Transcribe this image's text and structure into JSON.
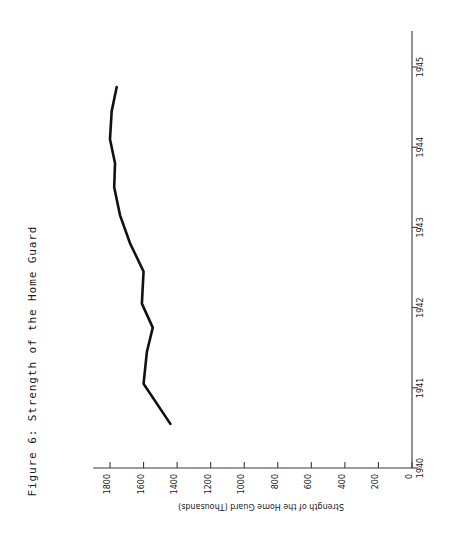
{
  "figure": {
    "caption": "Figure 6: Strength of the Home Guard",
    "orientation": "rotated-90-ccw",
    "background_color": "#ffffff",
    "line_color": "#111111",
    "axis_color": "#3a3a3a"
  },
  "chart_data": {
    "type": "line",
    "title": "Figure 6: Strength of the Home Guard",
    "xlabel": "",
    "ylabel": "Strength of the Home Guard (Thousands)",
    "xlim": [
      1940,
      1945
    ],
    "ylim": [
      0,
      1800
    ],
    "grid": false,
    "legend": null,
    "x_tick_labels": [
      "1940",
      "1941",
      "1942",
      "1943",
      "1944",
      "1945"
    ],
    "x_ticks": [
      1940,
      1941,
      1942,
      1943,
      1944,
      1945
    ],
    "y_tick_labels": [
      "0",
      "200",
      "400",
      "600",
      "800",
      "1000",
      "1200",
      "1400",
      "1600",
      "1800"
    ],
    "y_ticks": [
      0,
      200,
      400,
      600,
      800,
      1000,
      1200,
      1400,
      1600,
      1800
    ],
    "series": [
      {
        "name": "Home Guard strength",
        "x": [
          1940.55,
          1941.05,
          1941.45,
          1941.75,
          1942.05,
          1942.45,
          1942.8,
          1943.15,
          1943.5,
          1943.8,
          1944.1,
          1944.45,
          1944.75
        ],
        "values": [
          1440,
          1600,
          1580,
          1545,
          1610,
          1600,
          1680,
          1740,
          1775,
          1770,
          1800,
          1790,
          1760
        ]
      }
    ]
  },
  "axis_labels": {
    "value_axis_title": "Strength of the Home Guard (Thousands)",
    "years": [
      "1940",
      "1941",
      "1942",
      "1943",
      "1944",
      "1945"
    ],
    "values": [
      "0",
      "200",
      "400",
      "600",
      "800",
      "1000",
      "1200",
      "1400",
      "1600",
      "1800"
    ]
  }
}
